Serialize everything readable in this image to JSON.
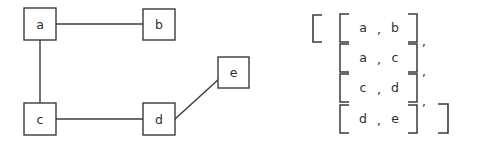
{
  "figure": {
    "kind": "graph-with-edge-list",
    "stroke_color": "#3b3b3b",
    "text_color": "#2e2e2e",
    "background_color": "#ffffff"
  },
  "graph": {
    "nodes": [
      {
        "id": "a",
        "label": "a",
        "x": 24,
        "y": 8,
        "w": 32,
        "h": 32
      },
      {
        "id": "b",
        "label": "b",
        "x": 143,
        "y": 9,
        "w": 32,
        "h": 31
      },
      {
        "id": "c",
        "label": "c",
        "x": 24,
        "y": 103,
        "w": 32,
        "h": 32
      },
      {
        "id": "d",
        "label": "d",
        "x": 143,
        "y": 103,
        "w": 32,
        "h": 32
      },
      {
        "id": "e",
        "label": "e",
        "x": 218,
        "y": 57,
        "w": 31,
        "h": 31
      }
    ],
    "edges": [
      {
        "from": "a",
        "to": "b",
        "x1": 56,
        "y1": 24,
        "x2": 143,
        "y2": 24
      },
      {
        "from": "a",
        "to": "c",
        "x1": 40,
        "y1": 40,
        "x2": 40,
        "y2": 103
      },
      {
        "from": "c",
        "to": "d",
        "x1": 56,
        "y1": 119,
        "x2": 143,
        "y2": 119
      },
      {
        "from": "d",
        "to": "e",
        "x1": 176,
        "y1": 118,
        "x2": 219,
        "y2": 79
      }
    ]
  },
  "edge_list": {
    "open_bracket": "[",
    "close_bracket": "]",
    "separator": ",",
    "pair_open": "[",
    "pair_close": "]",
    "rows": [
      {
        "left": "a",
        "comma": ",",
        "right": "b",
        "trailing": ","
      },
      {
        "left": "a",
        "comma": ",",
        "right": "c",
        "trailing": ","
      },
      {
        "left": "c",
        "comma": ",",
        "right": "d",
        "trailing": ","
      },
      {
        "left": "d",
        "comma": ",",
        "right": "e",
        "trailing": ""
      }
    ]
  }
}
